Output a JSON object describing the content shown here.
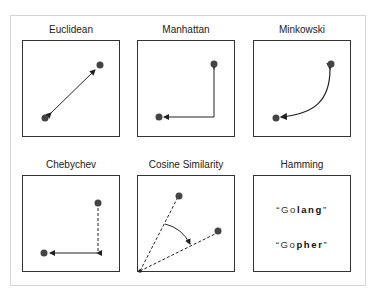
{
  "diagram": {
    "panels": [
      {
        "id": "euclidean",
        "label": "Euclidean"
      },
      {
        "id": "manhattan",
        "label": "Manhattan"
      },
      {
        "id": "minkowski",
        "label": "Minkowski"
      },
      {
        "id": "chebychev",
        "label": "Chebychev"
      },
      {
        "id": "cosine",
        "label": "Cosine Similarity"
      },
      {
        "id": "hamming",
        "label": "Hamming"
      }
    ],
    "hamming": {
      "word1": {
        "quote_open": "“",
        "same": "Go",
        "diff": "lang",
        "quote_close": "”"
      },
      "word2": {
        "quote_open": "“",
        "same": "Go",
        "diff": "pher",
        "quote_close": "”"
      }
    },
    "colors": {
      "point": "#444444",
      "line": "#222222",
      "box_border": "#333333",
      "frame_border": "#d4d4d4"
    }
  }
}
